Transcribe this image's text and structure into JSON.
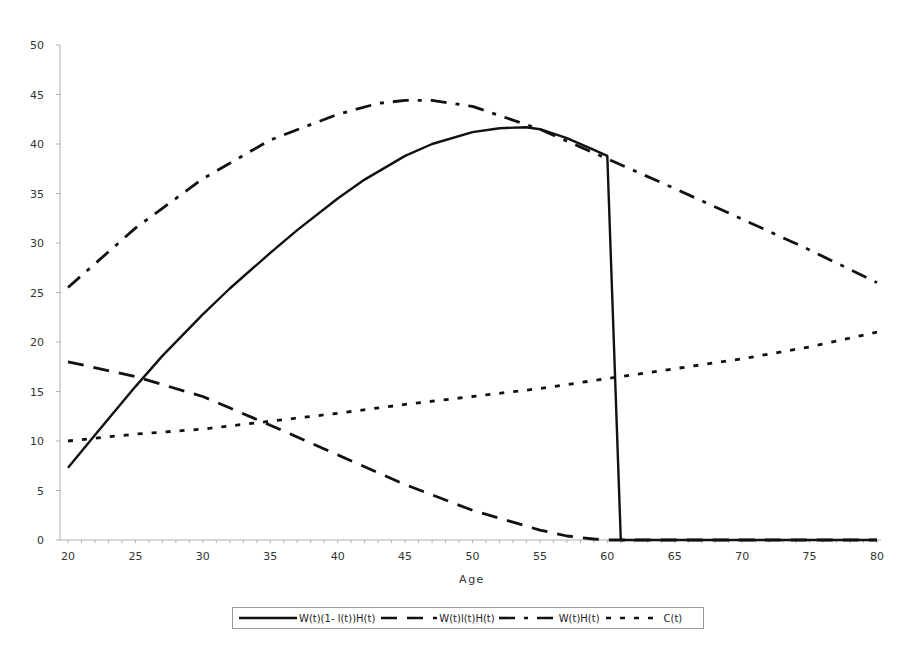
{
  "chart_data": {
    "type": "line",
    "title": "",
    "xlabel": "Age",
    "ylabel": "",
    "xlim": [
      20,
      80
    ],
    "ylim": [
      0,
      50
    ],
    "x_ticks": [
      20,
      25,
      30,
      35,
      40,
      45,
      50,
      55,
      60,
      65,
      70,
      75,
      80
    ],
    "y_ticks": [
      0,
      5,
      10,
      15,
      20,
      25,
      30,
      35,
      40,
      45,
      50
    ],
    "grid": false,
    "legend_position": "bottom",
    "series": [
      {
        "name": "W(t)(1- l(t))H(t)",
        "style": "solid",
        "points": [
          [
            20,
            7.3
          ],
          [
            22,
            10.6
          ],
          [
            25,
            15.5
          ],
          [
            27,
            18.6
          ],
          [
            30,
            22.8
          ],
          [
            32,
            25.4
          ],
          [
            35,
            29.0
          ],
          [
            37,
            31.3
          ],
          [
            40,
            34.5
          ],
          [
            42,
            36.4
          ],
          [
            45,
            38.8
          ],
          [
            47,
            40.0
          ],
          [
            50,
            41.2
          ],
          [
            52,
            41.6
          ],
          [
            54,
            41.7
          ],
          [
            55,
            41.5
          ],
          [
            57,
            40.6
          ],
          [
            59,
            39.4
          ],
          [
            60,
            38.8
          ],
          [
            61,
            0
          ],
          [
            65,
            0
          ],
          [
            70,
            0
          ],
          [
            75,
            0
          ],
          [
            80,
            0
          ]
        ]
      },
      {
        "name": "W(t)l(t)H(t)",
        "style": "dashed",
        "points": [
          [
            20,
            18.0
          ],
          [
            25,
            16.5
          ],
          [
            30,
            14.5
          ],
          [
            35,
            11.6
          ],
          [
            40,
            8.6
          ],
          [
            45,
            5.6
          ],
          [
            50,
            3.0
          ],
          [
            53,
            1.8
          ],
          [
            55,
            1.0
          ],
          [
            57,
            0.4
          ],
          [
            59,
            0.1
          ],
          [
            60,
            0
          ],
          [
            65,
            0
          ],
          [
            70,
            0
          ],
          [
            75,
            0
          ],
          [
            80,
            0
          ]
        ]
      },
      {
        "name": "W(t)H(t)",
        "style": "dash-dot",
        "points": [
          [
            20,
            25.5
          ],
          [
            25,
            31.5
          ],
          [
            30,
            36.5
          ],
          [
            35,
            40.4
          ],
          [
            40,
            43.0
          ],
          [
            43,
            44.1
          ],
          [
            45,
            44.4
          ],
          [
            47,
            44.4
          ],
          [
            50,
            43.8
          ],
          [
            55,
            41.5
          ],
          [
            60,
            38.5
          ],
          [
            65,
            35.5
          ],
          [
            70,
            32.4
          ],
          [
            75,
            29.3
          ],
          [
            80,
            26.0
          ]
        ]
      },
      {
        "name": "C(t)",
        "style": "dotted",
        "points": [
          [
            20,
            10.0
          ],
          [
            25,
            10.7
          ],
          [
            30,
            11.2
          ],
          [
            35,
            12.0
          ],
          [
            40,
            12.8
          ],
          [
            45,
            13.7
          ],
          [
            50,
            14.5
          ],
          [
            55,
            15.3
          ],
          [
            60,
            16.3
          ],
          [
            65,
            17.3
          ],
          [
            70,
            18.3
          ],
          [
            75,
            19.5
          ],
          [
            80,
            21.0
          ]
        ]
      }
    ]
  },
  "legend": {
    "items": [
      {
        "label": "W(t)(1- l(t))H(t)"
      },
      {
        "label": "W(t)l(t)H(t)"
      },
      {
        "label": "W(t)H(t)"
      },
      {
        "label": "C(t)"
      }
    ]
  },
  "axes": {
    "x_title": "Age"
  },
  "colors": {
    "line": "#111111",
    "axis": "#b0b0b0",
    "text": "#333333"
  }
}
